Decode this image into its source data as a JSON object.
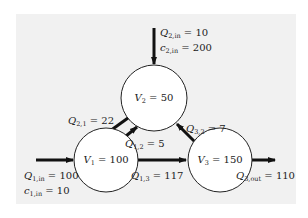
{
  "diagram": {
    "nodes": [
      {
        "id": "V1",
        "name": "V",
        "sub": "1",
        "value": "100",
        "cx": 106,
        "cy": 160,
        "r": 32
      },
      {
        "id": "V2",
        "name": "V",
        "sub": "2",
        "value": "50",
        "cx": 154,
        "cy": 98,
        "r": 33
      },
      {
        "id": "V3",
        "name": "V",
        "sub": "3",
        "value": "150",
        "cx": 220,
        "cy": 160,
        "r": 32
      }
    ],
    "labels": {
      "q2in": {
        "var": "Q",
        "sub": "2,in",
        "value": "10"
      },
      "c2in": {
        "var": "c",
        "sub": "2,in",
        "value": "200"
      },
      "q21": {
        "var": "Q",
        "sub": "2,1",
        "value": "22"
      },
      "q12": {
        "var": "Q",
        "sub": "1,2",
        "value": "5"
      },
      "q32": {
        "var": "Q",
        "sub": "3,2",
        "value": "7"
      },
      "q13": {
        "var": "Q",
        "sub": "1,3",
        "value": "117"
      },
      "q1in": {
        "var": "Q",
        "sub": "1,in",
        "value": "100"
      },
      "c1in": {
        "var": "c",
        "sub": "1,in",
        "value": "10"
      },
      "q3out": {
        "var": "Q",
        "sub": "3,out",
        "value": "110"
      }
    },
    "edges": [
      {
        "from": "external",
        "to": "V2",
        "label": "Q2,in = 10, c2,in = 200"
      },
      {
        "from": "V2",
        "to": "V1",
        "label": "Q2,1 = 22"
      },
      {
        "from": "V1",
        "to": "V2",
        "label": "Q1,2 = 5"
      },
      {
        "from": "V3",
        "to": "V2",
        "label": "Q3,2 = 7"
      },
      {
        "from": "V1",
        "to": "V3",
        "label": "Q1,3 = 117"
      },
      {
        "from": "external",
        "to": "V1",
        "label": "Q1,in = 100, c1,in = 10"
      },
      {
        "from": "V3",
        "to": "external",
        "label": "Q3,out = 110"
      }
    ],
    "colors": {
      "background": "#f1f1f1",
      "stroke": "#111111",
      "node_fill": "#ffffff"
    }
  }
}
